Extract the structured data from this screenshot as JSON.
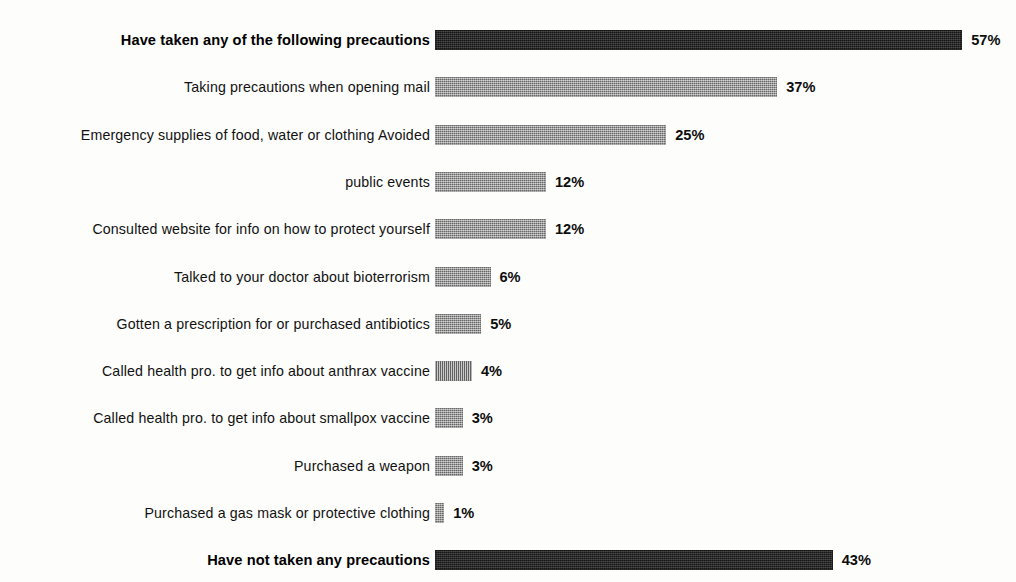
{
  "chart_data": {
    "type": "bar",
    "orientation": "horizontal",
    "title": "",
    "xlabel": "",
    "ylabel": "",
    "xlim": [
      0,
      57
    ],
    "grid": false,
    "legend": "none",
    "value_suffix": "%",
    "categories": [
      "Have taken any of the following precautions",
      "Taking precautions when opening mail",
      "Emergency supplies of food, water or clothing Avoided",
      "public events",
      "Consulted website for info on how to protect yourself",
      "Talked to your doctor about bioterrorism",
      "Gotten a prescription for or purchased antibiotics",
      "Called health pro. to get info about anthrax vaccine",
      "Called health pro. to get info about smallpox vaccine",
      "Purchased a weapon",
      "Purchased a gas mask or protective clothing",
      "Have not taken any precautions"
    ],
    "values": [
      57,
      37,
      25,
      12,
      12,
      6,
      5,
      4,
      3,
      3,
      1,
      43
    ],
    "value_labels": [
      "57%",
      "37%",
      "25%",
      "12%",
      "12%",
      "6%",
      "5%",
      "4%",
      "3%",
      "3%",
      "1%",
      "43%"
    ],
    "emphasis": [
      true,
      false,
      false,
      false,
      false,
      false,
      false,
      false,
      false,
      false,
      false,
      true
    ],
    "bar_colors": [
      "#262626",
      "#8b8b8b",
      "#8b8b8b",
      "#8b8b8b",
      "#8b8b8b",
      "#8b8b8b",
      "#8b8b8b",
      "#8b8b8b",
      "#8b8b8b",
      "#8b8b8b",
      "#8b8b8b",
      "#262626"
    ]
  },
  "style": {
    "background": "#fdfdfc",
    "label_color": "#111111",
    "value_color": "#0d0d0d",
    "dark_bar": "#262626",
    "gray_bar": "#8b8b8b"
  },
  "rows": [
    {
      "label": "Have taken any of the following precautions",
      "value": 57,
      "value_label": "57%"
    },
    {
      "label": "Taking precautions when opening mail",
      "value": 37,
      "value_label": "37%"
    },
    {
      "label": "Emergency supplies of food, water or clothing Avoided",
      "value": 25,
      "value_label": "25%"
    },
    {
      "label": "public events",
      "value": 12,
      "value_label": "12%"
    },
    {
      "label": "Consulted website for info on how to protect yourself",
      "value": 12,
      "value_label": "12%"
    },
    {
      "label": "Talked to your doctor about bioterrorism",
      "value": 6,
      "value_label": "6%"
    },
    {
      "label": "Gotten a prescription for or purchased antibiotics",
      "value": 5,
      "value_label": "5%"
    },
    {
      "label": "Called health pro. to get info about anthrax vaccine",
      "value": 4,
      "value_label": "4%"
    },
    {
      "label": "Called health pro. to get info about smallpox vaccine",
      "value": 3,
      "value_label": "3%"
    },
    {
      "label": "Purchased a weapon",
      "value": 3,
      "value_label": "3%"
    },
    {
      "label": "Purchased a gas mask or protective clothing",
      "value": 1,
      "value_label": "1%"
    },
    {
      "label": "Have not taken any precautions",
      "value": 43,
      "value_label": "43%"
    }
  ]
}
